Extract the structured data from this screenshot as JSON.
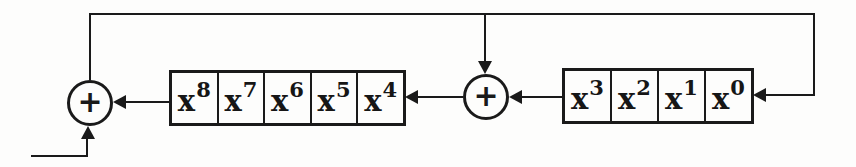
{
  "diagram": {
    "kind": "shift-register-with-feedback",
    "colors": {
      "ink": "#1a1a1a",
      "paper": "#fdfdfc"
    },
    "adders": [
      {
        "symbol": "+"
      },
      {
        "symbol": "+"
      }
    ],
    "high_register": {
      "cells": [
        {
          "base": "x",
          "exp": "8"
        },
        {
          "base": "x",
          "exp": "7"
        },
        {
          "base": "x",
          "exp": "6"
        },
        {
          "base": "x",
          "exp": "5"
        },
        {
          "base": "x",
          "exp": "4"
        }
      ]
    },
    "low_register": {
      "cells": [
        {
          "base": "x",
          "exp": "3"
        },
        {
          "base": "x",
          "exp": "2"
        },
        {
          "base": "x",
          "exp": "1"
        },
        {
          "base": "x",
          "exp": "0"
        }
      ]
    }
  }
}
